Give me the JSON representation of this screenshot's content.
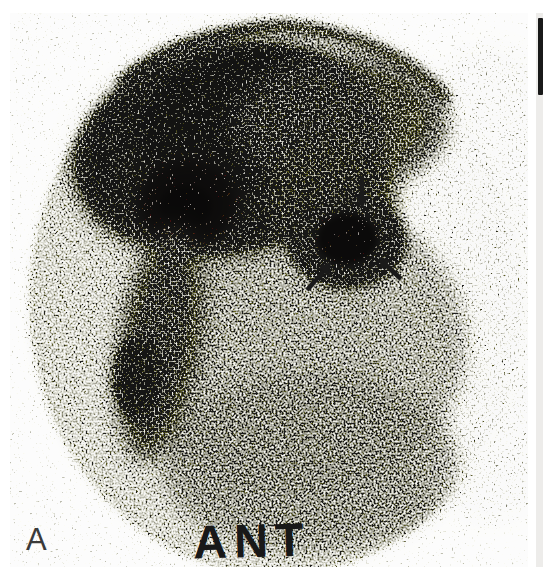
{
  "figure": {
    "panel_label": "A",
    "orientation_label": "ANT",
    "colors": {
      "page_background": "#ffffff",
      "film_background": "#efefec",
      "field_tone": "#c9c9c5",
      "dense_cloud": "#55504c",
      "lesion_core": "#44403c",
      "annotation_black": "#1a1a1a",
      "panel_label_color": "#3a3a3a",
      "adjacent_panel_bar": "#191919"
    },
    "arrows": [
      {
        "direction": "down"
      },
      {
        "direction": "up-right"
      },
      {
        "direction": "up-left"
      }
    ]
  }
}
